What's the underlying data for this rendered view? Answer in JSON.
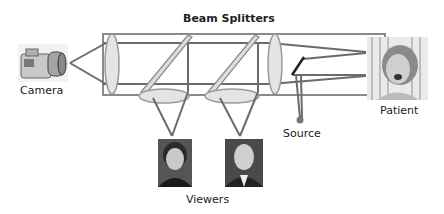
{
  "title": "Beam Splitters",
  "labels": {
    "beam_splitters": "Beam Splitters",
    "camera": "Camera",
    "patient": "Patient",
    "source": "Source",
    "viewers": "Viewers"
  },
  "components": {
    "camera": {
      "icon": "camera-photo"
    },
    "patient": {
      "icon": "patient-photo"
    },
    "viewers": [
      {
        "icon": "viewer-woman-photo"
      },
      {
        "icon": "viewer-man-photo"
      }
    ],
    "beam_splitter_count": 2,
    "lens_count": 2
  },
  "colors": {
    "line": "#6b6b6b",
    "lens_fill": "#e4e4e4",
    "splitter_fill": "#dcdcdc",
    "text": "#222222"
  }
}
